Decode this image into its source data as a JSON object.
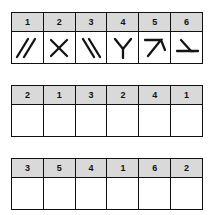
{
  "worksheet": {
    "title": "Symbol matching worksheet",
    "column_count": 6,
    "tables": [
      {
        "name": "key-table",
        "headers": [
          "1",
          "2",
          "3",
          "4",
          "5",
          "6"
        ],
        "body_type": "symbols",
        "symbols": [
          {
            "index": 1,
            "icon_name": "double-forward-slash-icon",
            "description": "two parallel diagonal strokes leaning right"
          },
          {
            "index": 2,
            "icon_name": "x-cross-icon",
            "description": "two strokes crossing in an X"
          },
          {
            "index": 3,
            "icon_name": "double-back-slash-icon",
            "description": "two parallel diagonal strokes leaning left"
          },
          {
            "index": 4,
            "icon_name": "y-fork-icon",
            "description": "upright Y fork"
          },
          {
            "index": 5,
            "icon_name": "y-fork-rotated-45-icon",
            "description": "Y fork rotated, resembling a seven"
          },
          {
            "index": 6,
            "icon_name": "y-fork-rotated-90-icon",
            "description": "Y fork lying on its side with horizontal base"
          }
        ]
      },
      {
        "name": "answer-table-1",
        "headers": [
          "2",
          "1",
          "3",
          "2",
          "4",
          "1"
        ],
        "body_type": "blank",
        "blank_values": [
          "",
          "",
          "",
          "",
          "",
          ""
        ]
      },
      {
        "name": "answer-table-2",
        "headers": [
          "3",
          "5",
          "4",
          "1",
          "6",
          "2"
        ],
        "body_type": "blank",
        "blank_values": [
          "",
          "",
          "",
          "",
          "",
          ""
        ]
      }
    ]
  },
  "colors": {
    "header_fill": "#d9d9d9",
    "line": "#101010",
    "stroke": "#141414",
    "page": "#ffffff"
  }
}
